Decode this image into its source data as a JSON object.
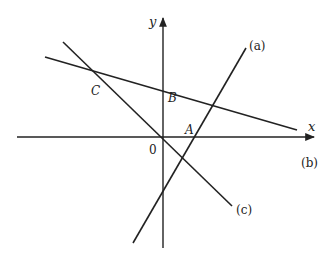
{
  "diagram": {
    "type": "coordinate-lines",
    "axes": {
      "x_label": "x",
      "y_label": "y",
      "origin_label": "0"
    },
    "lines": [
      {
        "id": "a",
        "label": "(a)",
        "slope_sign": "positive"
      },
      {
        "id": "b",
        "label": "(b)",
        "slope_sign": "negative"
      },
      {
        "id": "c",
        "label": "(c)",
        "slope_sign": "negative"
      }
    ],
    "points": [
      {
        "id": "A",
        "label": "A",
        "description": "intersection of lines (a) and (b)"
      },
      {
        "id": "B",
        "label": "B",
        "description": "y-intercept of line (b)"
      },
      {
        "id": "C",
        "label": "C",
        "description": "intersection of lines (b) and (c)"
      }
    ],
    "colors": {
      "line": "#222222",
      "background": "#ffffff"
    }
  }
}
